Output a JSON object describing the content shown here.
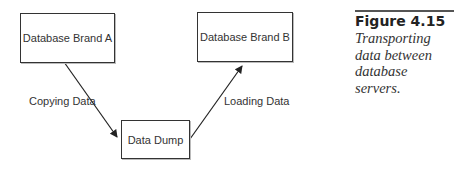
{
  "diagram": {
    "nodes": [
      {
        "id": "a",
        "label": "Database Brand A"
      },
      {
        "id": "b",
        "label": "Database Brand B"
      },
      {
        "id": "dump",
        "label": "Data Dump"
      }
    ],
    "edges": [
      {
        "from": "a",
        "to": "dump",
        "label": "Copying Data"
      },
      {
        "from": "dump",
        "to": "b",
        "label": "Loading Data"
      }
    ]
  },
  "caption": {
    "figure_number": "Figure 4.15",
    "text": "Transporting data between database servers."
  }
}
